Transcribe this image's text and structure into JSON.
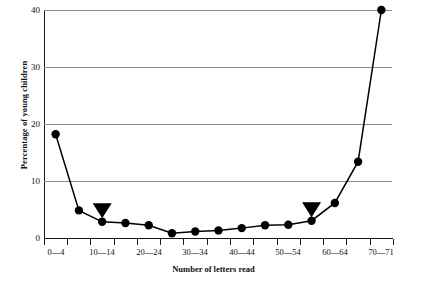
{
  "chart_data": {
    "type": "line",
    "title": "",
    "xlabel": "Number of letters read",
    "ylabel": "Percentage of young children",
    "categories": [
      "0—4",
      "5—9",
      "10—14",
      "15—19",
      "20—24",
      "25—29",
      "30—34",
      "35—39",
      "40—44",
      "45—49",
      "50—54",
      "55—59",
      "60—64",
      "65—69",
      "70—71"
    ],
    "tick_labels_visible": [
      "0—4",
      "10—14",
      "20—24",
      "30—34",
      "40—44",
      "50—54",
      "60—64",
      "70—71"
    ],
    "values": [
      18.3,
      5.0,
      3.0,
      2.8,
      2.4,
      1.0,
      1.3,
      1.5,
      1.9,
      2.4,
      2.5,
      3.2,
      6.3,
      13.5,
      40.0
    ],
    "ylim": [
      0,
      40
    ],
    "yticks": [
      0,
      10,
      20,
      30,
      40
    ],
    "ytick_labels": [
      "0",
      "10",
      "20",
      "30",
      "40"
    ],
    "grid": "horizontal",
    "legend": "none",
    "marker": "filled-circle",
    "annotations": [
      {
        "name": "triangle-marker-left",
        "category": "10—14",
        "shape": "down-triangle",
        "value": 3.0
      },
      {
        "name": "triangle-marker-right",
        "category": "55—59",
        "shape": "down-triangle",
        "value": 3.2
      }
    ],
    "colors": {
      "line": "#000000",
      "marker": "#000000",
      "grid": "#8c8c8c",
      "axis": "#1a1a1a",
      "background": "#ffffff"
    }
  }
}
